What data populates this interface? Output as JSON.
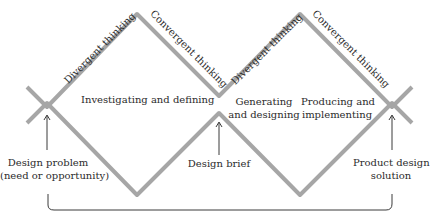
{
  "diagram": {
    "type": "double-diamond",
    "line_color": "#a6a6a6",
    "arrow_color": "#3a3a3a",
    "phase_labels": [
      {
        "label": "Divergent thinking"
      },
      {
        "label": "Convergent thinking"
      },
      {
        "label": "Divergent thinking"
      },
      {
        "label": "Convergent thinking"
      }
    ],
    "stages": [
      {
        "label": "Investigating and defining"
      },
      {
        "line1": "Generating",
        "line2": "and designing"
      },
      {
        "line1": "Producing and",
        "line2": "implementing"
      }
    ],
    "milestones": [
      {
        "line1": "Design problem",
        "line2": "(need or opportunity)"
      },
      {
        "label": "Design brief"
      },
      {
        "line1": "Product design",
        "line2": "solution"
      }
    ]
  }
}
